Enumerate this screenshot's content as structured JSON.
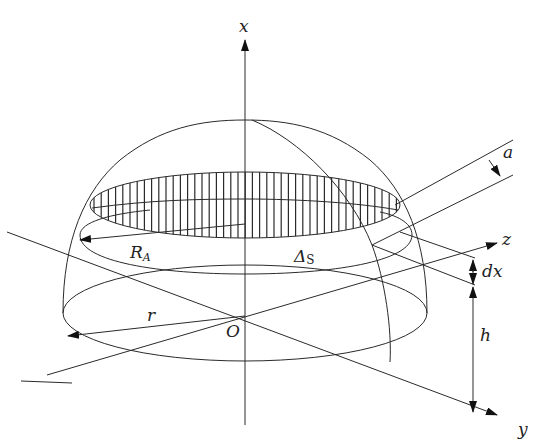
{
  "figure": {
    "labels": {
      "x_axis": "x",
      "y_axis": "y",
      "z_axis": "z",
      "origin": "O",
      "section_radius_main": "R",
      "section_radius_sub": "A",
      "base_radius": "r",
      "delta_main": "Δ",
      "delta_sub": "S",
      "slice_thickness": "dx",
      "height": "h",
      "plane_spacing": "a"
    },
    "colors": {
      "line": "#2a2a2a",
      "background": "#ffffff"
    }
  }
}
